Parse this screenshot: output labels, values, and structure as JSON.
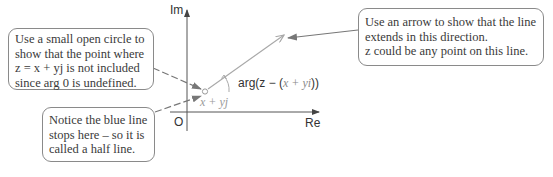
{
  "diagram": {
    "type": "argand-diagram-half-line",
    "axes": {
      "imaginary_label": "Im",
      "real_label": "Re",
      "origin_label": "O"
    },
    "point_label": "x + yj",
    "angle_label": {
      "prefix": "arg(",
      "variable": "z",
      "middle": " − (",
      "inner": "x + yi",
      "suffix": "))"
    },
    "colors": {
      "axis": "#555555",
      "half_line": "#a8a8a8",
      "pointer": "#7a7a7a",
      "callout_border": "#8a8a8a",
      "text": "#3a3a3a"
    }
  },
  "callouts": {
    "open_circle": {
      "lines": [
        "Use a small open circle to",
        "show that the point where",
        "z = x + yj is not included",
        "since arg 0 is undefined."
      ]
    },
    "half_line": {
      "lines": [
        "Notice the blue line",
        "stops here – so it is",
        "called a half line."
      ]
    },
    "direction": {
      "lines": [
        "Use an arrow to show that the line",
        "extends in this direction.",
        "z could be any point on this line."
      ]
    }
  }
}
